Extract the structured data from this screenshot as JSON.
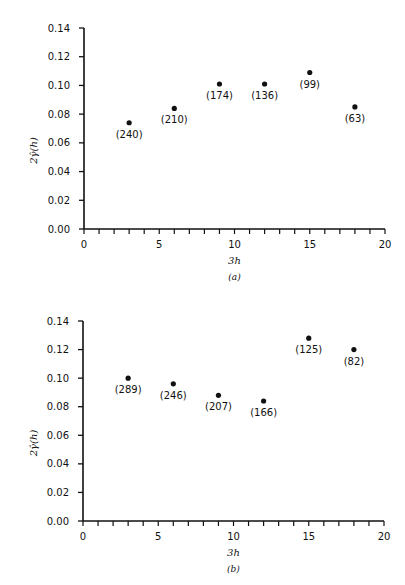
{
  "header": {
    "text": "SEMIVARIOGRAM (partial, cut off)"
  },
  "chart_data": [
    {
      "type": "scatter",
      "panel": "(a)",
      "xlabel": "3h",
      "ylabel": "2γ̂(h)",
      "xlim": [
        0,
        20
      ],
      "ylim": [
        0,
        0.14
      ],
      "xticks": [
        0,
        5,
        10,
        15,
        20
      ],
      "yticks": [
        "0.00",
        "0.02",
        "0.04",
        "0.06",
        "0.08",
        "0.10",
        "0.12",
        "0.14"
      ],
      "grid": false,
      "points": [
        {
          "x": 3,
          "y": 0.074,
          "label": "(240)"
        },
        {
          "x": 6,
          "y": 0.084,
          "label": "(210)"
        },
        {
          "x": 9,
          "y": 0.101,
          "label": "(174)"
        },
        {
          "x": 12,
          "y": 0.101,
          "label": "(136)"
        },
        {
          "x": 15,
          "y": 0.109,
          "label": "(99)"
        },
        {
          "x": 18,
          "y": 0.085,
          "label": "(63)"
        }
      ]
    },
    {
      "type": "scatter",
      "panel": "(b)",
      "xlabel": "3h",
      "ylabel": "2γ̂(h)",
      "xlim": [
        0,
        20
      ],
      "ylim": [
        0,
        0.14
      ],
      "xticks": [
        0,
        5,
        10,
        15,
        20
      ],
      "yticks": [
        "0.00",
        "0.02",
        "0.04",
        "0.06",
        "0.08",
        "0.10",
        "0.12",
        "0.14"
      ],
      "grid": false,
      "points": [
        {
          "x": 3,
          "y": 0.1,
          "label": "(289)"
        },
        {
          "x": 6,
          "y": 0.096,
          "label": "(246)"
        },
        {
          "x": 9,
          "y": 0.088,
          "label": "(207)"
        },
        {
          "x": 12,
          "y": 0.084,
          "label": "(166)"
        },
        {
          "x": 15,
          "y": 0.128,
          "label": "(125)"
        },
        {
          "x": 18,
          "y": 0.12,
          "label": "(82)"
        }
      ]
    }
  ]
}
